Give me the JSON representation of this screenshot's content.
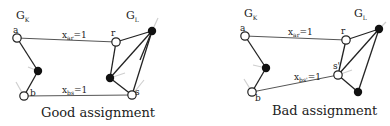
{
  "panels": [
    {
      "caption": "Good assignment",
      "graph_left_label": "G",
      "graph_left_sub": "K",
      "graph_right_label": "G",
      "graph_right_sub": "L",
      "nodes": {
        "a": "a",
        "b": "b",
        "r": "r",
        "s": "s"
      },
      "edges": [
        {
          "label": "x",
          "sub": "ar",
          "value": "=1"
        },
        {
          "label": "x",
          "sub": "bs",
          "value": "=1"
        }
      ]
    },
    {
      "caption": "Bad assignment",
      "graph_left_label": "G",
      "graph_left_sub": "K",
      "graph_right_label": "G",
      "graph_right_sub": "L",
      "nodes": {
        "a": "a",
        "b": "b",
        "r": "r",
        "s": "s'"
      },
      "edges": [
        {
          "label": "x",
          "sub": "ar",
          "value": "=1"
        },
        {
          "label": "x",
          "sub": "bs'",
          "value": "=1"
        }
      ]
    }
  ]
}
